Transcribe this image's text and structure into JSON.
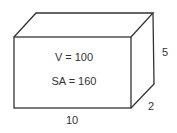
{
  "diagram": {
    "type": "rectangular-prism",
    "labels": {
      "volume": "V = 100",
      "surface_area": "SA = 160",
      "length": "10",
      "height": "5",
      "depth": "2"
    },
    "colors": {
      "stroke": "#333333",
      "background": "#ffffff"
    }
  }
}
